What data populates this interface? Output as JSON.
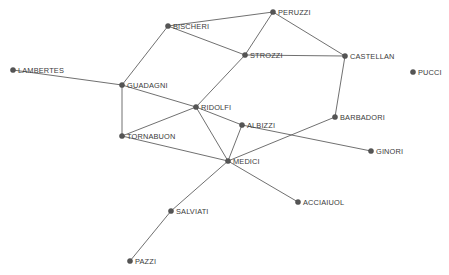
{
  "figure": {
    "title": "",
    "background_color": "#ffffff",
    "width": 449,
    "height": 275
  },
  "style": {
    "node_color": "#555555",
    "node_radius": 2.6,
    "edge_color": "#606060",
    "edge_width": 0.9,
    "label_color": "#3a3a3a",
    "label_font_size": 7.4
  },
  "chart_data": {
    "type": "scatter",
    "title": "",
    "xlabel": "",
    "ylabel": "",
    "layout": "node-link network diagram, no axes, no grid, no legend",
    "grid": false,
    "legend": null,
    "nodes": [
      {
        "id": "LAMBERTES",
        "label": "LAMBERTES",
        "x": 13,
        "y": 70,
        "label_dx": 5,
        "label_dy": -3
      },
      {
        "id": "BISCHERI",
        "label": "BISCHERI",
        "x": 168,
        "y": 26,
        "label_dx": 5,
        "label_dy": -3
      },
      {
        "id": "PERUZZI",
        "label": "PERUZZI",
        "x": 273,
        "y": 12,
        "label_dx": 5,
        "label_dy": -3
      },
      {
        "id": "STROZZI",
        "label": "STROZZI",
        "x": 245,
        "y": 55,
        "label_dx": 5,
        "label_dy": -3
      },
      {
        "id": "CASTELLAN",
        "label": "CASTELLAN",
        "x": 345,
        "y": 56,
        "label_dx": 5,
        "label_dy": -3
      },
      {
        "id": "PUCCI",
        "label": "PUCCI",
        "x": 413,
        "y": 72,
        "label_dx": 5,
        "label_dy": -3
      },
      {
        "id": "GUADAGNI",
        "label": "GUADAGNI",
        "x": 122,
        "y": 85,
        "label_dx": 5,
        "label_dy": -3
      },
      {
        "id": "RIDOLFI",
        "label": "RIDOLFI",
        "x": 196,
        "y": 107,
        "label_dx": 5,
        "label_dy": -3
      },
      {
        "id": "BARBADORI",
        "label": "BARBADORI",
        "x": 335,
        "y": 117,
        "label_dx": 5,
        "label_dy": -3
      },
      {
        "id": "ALBIZZI",
        "label": "ALBIZZI",
        "x": 242,
        "y": 125,
        "label_dx": 5,
        "label_dy": -3
      },
      {
        "id": "TORNABUON",
        "label": "TORNABUON",
        "x": 122,
        "y": 136,
        "label_dx": 5,
        "label_dy": -3
      },
      {
        "id": "GINORI",
        "label": "GINORI",
        "x": 371,
        "y": 151,
        "label_dx": 5,
        "label_dy": -3
      },
      {
        "id": "MEDICI",
        "label": "MEDICI",
        "x": 228,
        "y": 161,
        "label_dx": 5,
        "label_dy": -3
      },
      {
        "id": "ACCIAIUOL",
        "label": "ACCIAIUOL",
        "x": 298,
        "y": 202,
        "label_dx": 5,
        "label_dy": -3
      },
      {
        "id": "SALVIATI",
        "label": "SALVIATI",
        "x": 171,
        "y": 211,
        "label_dx": 5,
        "label_dy": -3
      },
      {
        "id": "PAZZI",
        "label": "PAZZI",
        "x": 130,
        "y": 261,
        "label_dx": 5,
        "label_dy": -3
      }
    ],
    "edges": [
      {
        "source": "LAMBERTES",
        "target": "GUADAGNI"
      },
      {
        "source": "GUADAGNI",
        "target": "BISCHERI"
      },
      {
        "source": "GUADAGNI",
        "target": "TORNABUON"
      },
      {
        "source": "GUADAGNI",
        "target": "RIDOLFI"
      },
      {
        "source": "BISCHERI",
        "target": "PERUZZI"
      },
      {
        "source": "BISCHERI",
        "target": "STROZZI"
      },
      {
        "source": "PERUZZI",
        "target": "STROZZI"
      },
      {
        "source": "PERUZZI",
        "target": "CASTELLAN"
      },
      {
        "source": "STROZZI",
        "target": "CASTELLAN"
      },
      {
        "source": "STROZZI",
        "target": "RIDOLFI"
      },
      {
        "source": "CASTELLAN",
        "target": "BARBADORI"
      },
      {
        "source": "RIDOLFI",
        "target": "ALBIZZI"
      },
      {
        "source": "RIDOLFI",
        "target": "TORNABUON"
      },
      {
        "source": "RIDOLFI",
        "target": "MEDICI"
      },
      {
        "source": "ALBIZZI",
        "target": "GINORI"
      },
      {
        "source": "ALBIZZI",
        "target": "MEDICI"
      },
      {
        "source": "BARBADORI",
        "target": "MEDICI"
      },
      {
        "source": "TORNABUON",
        "target": "MEDICI"
      },
      {
        "source": "MEDICI",
        "target": "ACCIAIUOL"
      },
      {
        "source": "MEDICI",
        "target": "SALVIATI"
      },
      {
        "source": "SALVIATI",
        "target": "PAZZI"
      }
    ]
  }
}
